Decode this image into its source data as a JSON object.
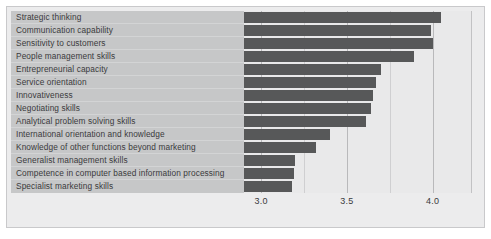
{
  "chart_data": {
    "type": "bar",
    "orientation": "horizontal",
    "title": "",
    "xlabel": "",
    "ylabel": "",
    "xlim": [
      2.9,
      4.23
    ],
    "grid": true,
    "legend": null,
    "xticks": [
      "3.0",
      "3.5",
      "4.0"
    ],
    "xtick_values": [
      3.0,
      3.5,
      4.0
    ],
    "categories": [
      "Strategic thinking",
      "Communication capability",
      "Sensitivity to customers",
      "People management skills",
      "Entrepreneurial capacity",
      "Service orientation",
      "Innovativeness",
      "Negotiating skills",
      "Analytical problem solving skills",
      "International orientation and knowledge",
      "Knowledge of other functions beyond marketing",
      "Generalist management skills",
      "Competence in computer based information processing",
      "Specialist marketing skills"
    ],
    "values": [
      4.05,
      3.99,
      4.0,
      3.89,
      3.7,
      3.67,
      3.65,
      3.64,
      3.61,
      3.4,
      3.32,
      3.2,
      3.19,
      3.18
    ],
    "bar_color": "#575859",
    "plot_background": "#e9e9ea",
    "label_panel_color": "#c6c7c8",
    "frame_color": "#ececed"
  }
}
